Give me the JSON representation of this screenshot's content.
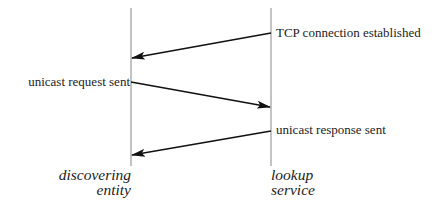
{
  "diagram": {
    "type": "sequence",
    "participants": [
      {
        "id": "left",
        "label_line1": "discovering",
        "label_line2": "entity"
      },
      {
        "id": "right",
        "label_line1": "lookup",
        "label_line2": "service"
      }
    ],
    "messages": [
      {
        "from": "right",
        "to": "left",
        "label": "TCP connection established"
      },
      {
        "from": "left",
        "to": "right",
        "label": "unicast request sent"
      },
      {
        "from": "right",
        "to": "left",
        "label": "unicast response sent"
      }
    ]
  }
}
